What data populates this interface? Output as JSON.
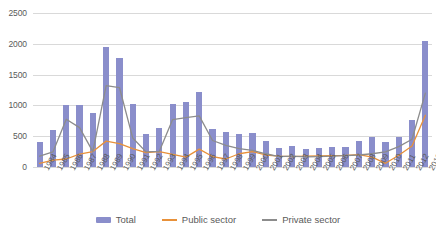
{
  "chart_data": {
    "type": "bar",
    "title": "",
    "subtitle": "",
    "xlabel": "",
    "ylabel": "",
    "ylim": [
      0,
      2500
    ],
    "ytick_values": [
      0,
      500,
      1000,
      1500,
      2000,
      2500
    ],
    "ytick_labels": [
      "0",
      "500",
      "1000",
      "1500",
      "2000",
      "2500"
    ],
    "grid": true,
    "legend_position": "bottom",
    "categories": [
      "1984",
      "1985",
      "1986",
      "1987",
      "1988",
      "1989",
      "1990",
      "1991",
      "1992",
      "1993",
      "1994",
      "1995",
      "1996",
      "1997",
      "1998",
      "1999",
      "2000",
      "2001",
      "2002",
      "2003",
      "2004",
      "2005",
      "2006",
      "2007",
      "2008",
      "2009",
      "2010",
      "2011",
      "2012",
      "2013"
    ],
    "series": [
      {
        "name": "Total",
        "kind": "bar",
        "color": "#8a8ecb",
        "values": [
          400,
          605,
          1010,
          1000,
          870,
          1950,
          1770,
          1030,
          540,
          630,
          1015,
          1050,
          1220,
          615,
          570,
          530,
          550,
          430,
          310,
          340,
          300,
          310,
          320,
          330,
          420,
          490,
          400,
          490,
          770,
          2050
        ]
      },
      {
        "name": "Public sector",
        "kind": "line",
        "color": "#e8913a",
        "values": [
          60,
          110,
          130,
          210,
          250,
          420,
          380,
          300,
          235,
          250,
          205,
          160,
          290,
          170,
          130,
          215,
          250,
          195,
          175,
          170,
          175,
          180,
          185,
          190,
          200,
          160,
          60,
          190,
          340,
          840
        ]
      },
      {
        "name": "Private sector",
        "kind": "line",
        "color": "#8c8c8c",
        "values": [
          175,
          245,
          775,
          640,
          250,
          1320,
          1290,
          470,
          245,
          255,
          770,
          800,
          830,
          430,
          350,
          300,
          270,
          215,
          170,
          175,
          165,
          170,
          175,
          185,
          195,
          215,
          245,
          330,
          450,
          1200
        ]
      }
    ]
  },
  "legend": {
    "items": [
      {
        "label": "Total",
        "color": "#8a8ecb",
        "kind": "bar"
      },
      {
        "label": "Public sector",
        "color": "#e8913a",
        "kind": "line"
      },
      {
        "label": "Private sector",
        "color": "#8c8c8c",
        "kind": "line"
      }
    ]
  }
}
